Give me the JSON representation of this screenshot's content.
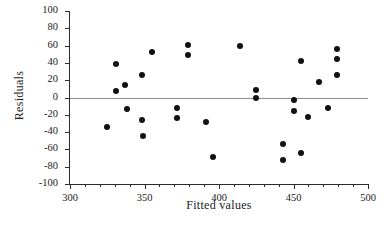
{
  "chart_data": {
    "type": "scatter",
    "title": "",
    "xlabel": "Fitted values",
    "ylabel": "Residuals",
    "xlim": [
      300,
      500
    ],
    "ylim": [
      -100,
      100
    ],
    "xticks": [
      300,
      350,
      400,
      450,
      500
    ],
    "xtick_labels": [
      "300",
      "350",
      "400",
      "450",
      "500"
    ],
    "x_minor_tick_step": 10,
    "yticks": [
      -100,
      -80,
      -60,
      -40,
      -20,
      0,
      20,
      40,
      60,
      80,
      100
    ],
    "ytick_labels": [
      "-100",
      "-80",
      "-60",
      "-40",
      "-20",
      "0",
      "20",
      "40",
      "60",
      "80",
      "100"
    ],
    "grid": false,
    "legend": null,
    "reference_lines": [
      {
        "name": "zero-residual-line",
        "orientation": "horizontal",
        "y": 0,
        "color": "#8a8a8a"
      }
    ],
    "marker": {
      "shape": "circle",
      "filled": true,
      "color": "#111111",
      "size": 6
    },
    "points": [
      {
        "x": 325,
        "y": -34
      },
      {
        "x": 331,
        "y": 39
      },
      {
        "x": 331,
        "y": 8
      },
      {
        "x": 337,
        "y": 14
      },
      {
        "x": 338,
        "y": -13
      },
      {
        "x": 348,
        "y": 26
      },
      {
        "x": 348,
        "y": -26
      },
      {
        "x": 349,
        "y": -44
      },
      {
        "x": 355,
        "y": 53
      },
      {
        "x": 372,
        "y": -12
      },
      {
        "x": 372,
        "y": -24
      },
      {
        "x": 379,
        "y": 61
      },
      {
        "x": 379,
        "y": 49
      },
      {
        "x": 391,
        "y": -28
      },
      {
        "x": 396,
        "y": -69
      },
      {
        "x": 414,
        "y": 59
      },
      {
        "x": 425,
        "y": 9
      },
      {
        "x": 425,
        "y": -1
      },
      {
        "x": 443,
        "y": -54
      },
      {
        "x": 443,
        "y": -72
      },
      {
        "x": 450,
        "y": -3
      },
      {
        "x": 450,
        "y": -16
      },
      {
        "x": 455,
        "y": 42
      },
      {
        "x": 455,
        "y": -64
      },
      {
        "x": 460,
        "y": -22
      },
      {
        "x": 467,
        "y": 18
      },
      {
        "x": 473,
        "y": -12
      },
      {
        "x": 479,
        "y": 56
      },
      {
        "x": 479,
        "y": 45
      },
      {
        "x": 479,
        "y": 26
      }
    ]
  },
  "colors": {
    "axis": "#2b2b2b",
    "marker": "#111111",
    "zero_line": "#8a8a8a",
    "text": "#1a1a1a",
    "background": "#ffffff"
  }
}
